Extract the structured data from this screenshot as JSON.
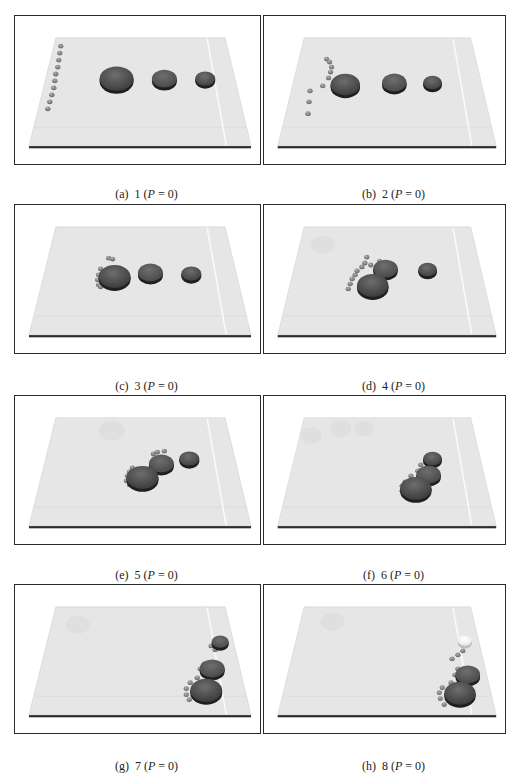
{
  "figure": {
    "panels": [
      {
        "id": "a",
        "label": "(a)",
        "step": "1",
        "param": "P",
        "value": "0",
        "discs": [
          {
            "cx": 102,
            "cy": 63,
            "r": 17,
            "shade": "#3a3a3a"
          },
          {
            "cx": 150,
            "cy": 63,
            "r": 12.5,
            "shade": "#474747"
          },
          {
            "cx": 191,
            "cy": 63,
            "r": 10,
            "shade": "#3e3e3e"
          }
        ],
        "robots": [
          [
            46,
            30
          ],
          [
            45,
            37
          ],
          [
            44,
            44
          ],
          [
            43,
            51
          ],
          [
            41,
            58
          ],
          [
            40,
            65
          ],
          [
            39,
            72
          ],
          [
            37,
            79
          ],
          [
            35,
            86
          ],
          [
            33,
            93
          ]
        ],
        "ghosts": []
      },
      {
        "id": "b",
        "label": "(b)",
        "step": "2",
        "param": "P",
        "value": "0",
        "discs": [
          {
            "cx": 83,
            "cy": 69,
            "r": 15,
            "shade": "#3a3a3a"
          },
          {
            "cx": 133,
            "cy": 67,
            "r": 12.5,
            "shade": "#474747"
          },
          {
            "cx": 172,
            "cy": 67,
            "r": 9.5,
            "shade": "#3e3e3e"
          }
        ],
        "robots": [
          [
            64,
            43
          ],
          [
            67,
            46
          ],
          [
            69,
            51
          ],
          [
            68,
            56
          ],
          [
            66,
            62
          ],
          [
            60,
            70
          ],
          [
            47,
            75
          ],
          [
            46,
            86
          ],
          [
            45,
            98
          ]
        ],
        "ghosts": []
      },
      {
        "id": "c",
        "label": "(c)",
        "step": "3",
        "param": "P",
        "value": "0",
        "discs": [
          {
            "cx": 100,
            "cy": 72,
            "r": 16,
            "shade": "#383838"
          },
          {
            "cx": 136,
            "cy": 68,
            "r": 12.5,
            "shade": "#474747"
          },
          {
            "cx": 177,
            "cy": 69,
            "r": 10,
            "shade": "#3e3e3e"
          }
        ],
        "robots": [
          [
            94,
            53
          ],
          [
            98,
            54
          ],
          [
            86,
            64
          ],
          [
            84,
            70
          ],
          [
            83,
            75
          ],
          [
            84,
            80
          ],
          [
            86,
            82
          ]
        ],
        "ghosts": []
      },
      {
        "id": "d",
        "label": "(d)",
        "step": "4",
        "param": "P",
        "value": "0",
        "discs": [
          {
            "cx": 111,
            "cy": 81,
            "r": 16,
            "shade": "#383838"
          },
          {
            "cx": 124,
            "cy": 64,
            "r": 12.5,
            "shade": "#474747"
          },
          {
            "cx": 167,
            "cy": 65,
            "r": 9.5,
            "shade": "#3e3e3e"
          }
        ],
        "robots": [
          [
            105,
            52
          ],
          [
            103,
            58
          ],
          [
            100,
            62
          ],
          [
            95,
            66
          ],
          [
            93,
            70
          ],
          [
            90,
            74
          ],
          [
            88,
            79
          ],
          [
            86,
            84
          ],
          [
            109,
            60
          ],
          [
            118,
            56
          ]
        ],
        "ghosts": [
          {
            "cx": 60,
            "cy": 40,
            "r": 12
          }
        ]
      },
      {
        "id": "e",
        "label": "(e)",
        "step": "5",
        "param": "P",
        "value": "0",
        "discs": [
          {
            "cx": 128,
            "cy": 82,
            "r": 16,
            "shade": "#383838"
          },
          {
            "cx": 147,
            "cy": 68,
            "r": 12.5,
            "shade": "#474747"
          },
          {
            "cx": 175,
            "cy": 63,
            "r": 10,
            "shade": "#3e3e3e"
          }
        ],
        "robots": [
          [
            118,
            72
          ],
          [
            115,
            76
          ],
          [
            113,
            80
          ],
          [
            112,
            85
          ],
          [
            115,
            89
          ],
          [
            139,
            58
          ],
          [
            143,
            56
          ],
          [
            150,
            55
          ]
        ],
        "ghosts": [
          {
            "cx": 97,
            "cy": 35,
            "r": 13
          }
        ]
      },
      {
        "id": "f",
        "label": "(f)",
        "step": "6",
        "param": "P",
        "value": "0",
        "discs": [
          {
            "cx": 155,
            "cy": 93,
            "r": 16,
            "shade": "#383838"
          },
          {
            "cx": 168,
            "cy": 79,
            "r": 12.5,
            "shade": "#474747"
          },
          {
            "cx": 172,
            "cy": 63,
            "r": 9.5,
            "shade": "#3e3e3e"
          }
        ],
        "robots": [
          [
            144,
            86
          ],
          [
            141,
            90
          ],
          [
            141,
            95
          ],
          [
            143,
            100
          ],
          [
            150,
            80
          ],
          [
            157,
            75
          ],
          [
            160,
            69
          ],
          [
            165,
            66
          ]
        ],
        "ghosts": [
          {
            "cx": 48,
            "cy": 40,
            "r": 11
          },
          {
            "cx": 78,
            "cy": 33,
            "r": 11
          },
          {
            "cx": 102,
            "cy": 33,
            "r": 10
          }
        ]
      },
      {
        "id": "g",
        "label": "(g)",
        "step": "7",
        "param": "P",
        "value": "0",
        "discs": [
          {
            "cx": 192,
            "cy": 106,
            "r": 16,
            "shade": "#383838"
          },
          {
            "cx": 198,
            "cy": 84,
            "r": 12.5,
            "shade": "#474747"
          },
          {
            "cx": 206,
            "cy": 57,
            "r": 8.5,
            "shade": "#4a4a4a"
          }
        ],
        "robots": [
          [
            176,
            98
          ],
          [
            172,
            104
          ],
          [
            172,
            110
          ],
          [
            175,
            115
          ],
          [
            183,
            93
          ],
          [
            186,
            84
          ],
          [
            190,
            79
          ],
          [
            201,
            65
          ],
          [
            197,
            61
          ]
        ],
        "ghosts": [
          {
            "cx": 63,
            "cy": 40,
            "r": 12
          }
        ]
      },
      {
        "id": "h",
        "label": "(h)",
        "step": "8",
        "param": "P",
        "value": "0",
        "discs": [
          {
            "cx": 200,
            "cy": 109,
            "r": 16,
            "shade": "#383838"
          },
          {
            "cx": 208,
            "cy": 90,
            "r": 12.5,
            "shade": "#474747"
          },
          {
            "cx": 205,
            "cy": 56,
            "r": 7,
            "shade": "#e8e8e8"
          }
        ],
        "robots": [
          [
            182,
            103
          ],
          [
            179,
            108
          ],
          [
            180,
            114
          ],
          [
            184,
            120
          ],
          [
            191,
            98
          ],
          [
            195,
            90
          ],
          [
            198,
            84
          ],
          [
            203,
            66
          ],
          [
            198,
            70
          ],
          [
            192,
            74
          ]
        ],
        "ghosts": [
          {
            "cx": 70,
            "cy": 37,
            "r": 12
          }
        ]
      }
    ]
  },
  "colors": {
    "floor": "#e6e6e6",
    "floor_edge": "#d2d2d2",
    "base_line": "#2c2c2c",
    "lane_line": "#fafafa",
    "frame_border": "#2a2a2a",
    "robot": "#8a8a8a",
    "ghost": "#dcdcdc"
  }
}
